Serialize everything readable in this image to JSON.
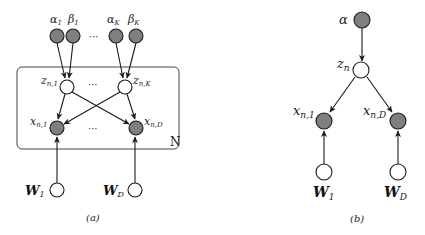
{
  "colors": {
    "observed_fill": "#7f7f7f",
    "latent_fill": "#ffffff",
    "stroke": "#1a1a1a",
    "plate_stroke": "#444444"
  },
  "panel_a": {
    "caption": "(a)",
    "plate_label": "N",
    "dots": "···",
    "nodes": {
      "alpha1": {
        "name": "α",
        "sub": "1"
      },
      "beta1": {
        "name": "β",
        "sub": "1"
      },
      "alphaK": {
        "name": "α",
        "sub": "K"
      },
      "betaK": {
        "name": "β",
        "sub": "K"
      },
      "z1": {
        "name": "z",
        "sub": "n,1"
      },
      "zK": {
        "name": "z",
        "sub": "n,K"
      },
      "x1": {
        "name": "x",
        "sub": "n,1"
      },
      "xD": {
        "name": "x",
        "sub": "n,D"
      },
      "W1": {
        "name": "W",
        "sub": "1"
      },
      "WD": {
        "name": "W",
        "sub": "D"
      }
    }
  },
  "panel_b": {
    "caption": "(b)",
    "nodes": {
      "alpha": {
        "name": "α"
      },
      "z": {
        "name": "z",
        "sub": "n"
      },
      "x1": {
        "name": "x",
        "sub": "n,1"
      },
      "xD": {
        "name": "x",
        "sub": "n,D"
      },
      "W1": {
        "name": "W",
        "sub": "1"
      },
      "WD": {
        "name": "W",
        "sub": "D"
      }
    }
  }
}
